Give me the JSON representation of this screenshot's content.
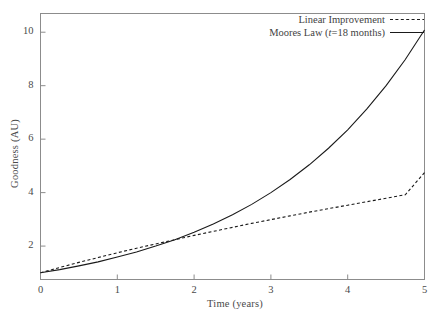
{
  "chart_data": {
    "type": "line",
    "title": "",
    "xlabel": "Time (years)",
    "ylabel": "Goodness (AU)",
    "xlim": [
      0,
      5
    ],
    "ylim": [
      0.75,
      10.7
    ],
    "xticks": [
      "0",
      "1",
      "2",
      "3",
      "4",
      "5"
    ],
    "yticks": [
      "2",
      "4",
      "6",
      "8",
      "10"
    ],
    "grid": false,
    "legend_position": "top-right",
    "x": [
      0,
      0.25,
      0.5,
      0.75,
      1,
      1.25,
      1.5,
      1.75,
      2,
      2.25,
      2.5,
      2.75,
      3,
      3.25,
      3.5,
      3.75,
      4,
      4.25,
      4.5,
      4.75,
      5
    ],
    "series": [
      {
        "name": "Linear Improvement",
        "style": "dashed",
        "color": "#1a1a1a",
        "values": [
          1.0,
          1.2,
          1.39,
          1.57,
          1.75,
          1.92,
          2.08,
          2.24,
          2.4,
          2.55,
          2.7,
          2.85,
          2.99,
          3.13,
          3.27,
          3.4,
          3.53,
          3.66,
          3.79,
          3.92,
          4.75
        ]
      },
      {
        "name": "Moores Law (t=18 months)",
        "name_prefix": "Moores Law (",
        "name_italic": "t",
        "name_suffix": "=18 months)",
        "style": "solid",
        "color": "#1a1a1a",
        "values": [
          1.0,
          1.12,
          1.26,
          1.41,
          1.59,
          1.78,
          2.0,
          2.24,
          2.52,
          2.83,
          3.17,
          3.56,
          4.0,
          4.49,
          5.04,
          5.66,
          6.35,
          7.13,
          8.0,
          8.98,
          10.08
        ]
      }
    ],
    "legend": [
      {
        "label": "Linear Improvement",
        "style": "dashed"
      },
      {
        "label": "Moores Law (t=18 months)",
        "style": "solid"
      }
    ],
    "axis_color": "#8c8c8c",
    "text_color": "#4a4a4a"
  }
}
